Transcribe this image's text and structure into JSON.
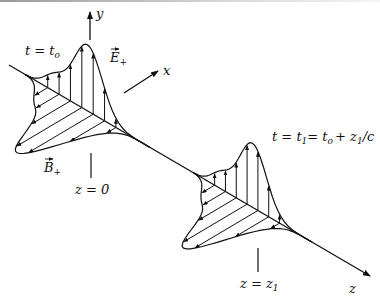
{
  "figure": {
    "axes": {
      "y_label": "y",
      "x_label": "x",
      "z_label": "z"
    },
    "pulse_1": {
      "time_label_lhs": "t",
      "time_label_rhs": "t",
      "time_label_sub": "o",
      "position_label": "z = 0",
      "e_field_label": "E",
      "e_field_sub": "+",
      "b_field_label": "B",
      "b_field_sub": "+"
    },
    "pulse_2": {
      "time_label_main": "t = t",
      "time_label_sub1": "1",
      "time_label_mid": "= t",
      "time_label_sub2": "o",
      "time_label_tail": "+ z",
      "time_label_sub3": "1",
      "time_label_end": "/c",
      "position_label_main": "z = z",
      "position_label_sub": "1"
    },
    "colors": {
      "ink": "#111111",
      "background": "#ffffff"
    }
  }
}
